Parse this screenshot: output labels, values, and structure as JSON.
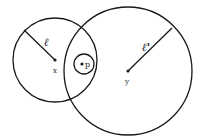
{
  "diagram": {
    "type": "geometric-neighborhoods",
    "stroke_color": "#1a1a1a",
    "background": "#ffffff",
    "circles": [
      {
        "id": "ball-x",
        "center": {
          "label": "x",
          "cx": 55,
          "cy": 60
        },
        "r": 42,
        "radius_label": "ℓ"
      },
      {
        "id": "ball-y",
        "center": {
          "label": "y",
          "cx": 128,
          "cy": 71
        },
        "r": 64,
        "radius_label": "ℓ'"
      },
      {
        "id": "ball-p",
        "center": {
          "label": "p",
          "cx": 84,
          "cy": 64
        },
        "r": 10
      }
    ],
    "labels": {
      "x": "x",
      "y": "y",
      "p": "p",
      "l": "ℓ",
      "l_prime": "ℓ'"
    }
  }
}
